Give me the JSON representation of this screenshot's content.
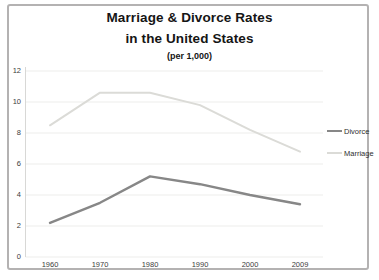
{
  "title": {
    "line1": "Marriage & Divorce Rates",
    "line2": "in the United States",
    "subtitle": "(per 1,000)"
  },
  "colors": {
    "divorce_line": "#878787",
    "marriage_line": "#dbdbd7",
    "gridline": "#ededeb",
    "axis_line": "#d8d8d6",
    "frame_border": "#b4b2b2",
    "title_text": "#151515",
    "tick_text": "#3c3c3c"
  },
  "legend": {
    "items": [
      {
        "label": "Divorce"
      },
      {
        "label": "Marriage"
      }
    ]
  },
  "chart_data": {
    "type": "line",
    "title": "Marriage & Divorce Rates in the United States (per 1,000)",
    "categories": [
      "1960",
      "1970",
      "1980",
      "1990",
      "2000",
      "2009"
    ],
    "series": [
      {
        "name": "Divorce",
        "values": [
          2.2,
          3.5,
          5.2,
          4.7,
          4.0,
          3.4
        ],
        "color": "#878787",
        "stroke_width": 2.4
      },
      {
        "name": "Marriage",
        "values": [
          8.5,
          10.6,
          10.6,
          9.8,
          8.2,
          6.8
        ],
        "color": "#dbdbd7",
        "stroke_width": 2.0
      }
    ],
    "xlabel": "",
    "ylabel": "",
    "ylim": [
      0,
      12
    ],
    "yticks": [
      0,
      2,
      4,
      6,
      8,
      10,
      12
    ],
    "grid": true,
    "legend_position": "right-outside"
  }
}
